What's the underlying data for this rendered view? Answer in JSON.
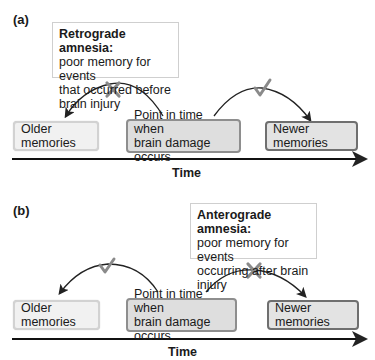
{
  "panels": [
    {
      "label": "(a)",
      "callout": {
        "title": "Retrograde amnesia:",
        "lines": [
          "poor memory for events",
          "that occurred before",
          "brain injury"
        ]
      },
      "boxes": {
        "older": "Older memories",
        "point_line1": "Point in time when",
        "point_line2": "brain damage occurs",
        "newer": "Newer memories"
      },
      "left_arc_mark": "cross-icon",
      "right_arc_mark": "check-icon",
      "axis_label": "Time"
    },
    {
      "label": "(b)",
      "callout": {
        "title": "Anterograde amnesia:",
        "lines": [
          "poor memory for events",
          "occurring after brain",
          "injury"
        ]
      },
      "boxes": {
        "older": "Older memories",
        "point_line1": "Point in time when",
        "point_line2": "brain damage occurs",
        "newer": "Newer memories"
      },
      "left_arc_mark": "check-icon",
      "right_arc_mark": "cross-icon",
      "axis_label": "Time"
    }
  ],
  "colors": {
    "mark_gray": "#8a8a8a",
    "arrow": "#222222",
    "box_border_dark": "#6f6f6f",
    "box_border_light": "#d2d2d2"
  }
}
